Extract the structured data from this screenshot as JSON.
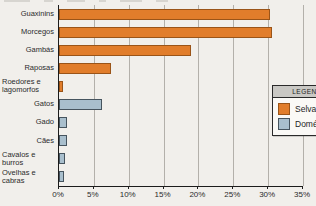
{
  "chart_data": {
    "type": "bar",
    "orientation": "horizontal",
    "title": "",
    "xlabel": "",
    "ylabel": "",
    "xlim": [
      0,
      35
    ],
    "grid": true,
    "xticks": [
      "0%",
      "5%",
      "10%",
      "15%",
      "20%",
      "25%",
      "30%",
      "35%"
    ],
    "categories": [
      "Guaxinins",
      "Morcegos",
      "Gambás",
      "Raposas",
      "Roedores e\nlagomorfos",
      "Gatos",
      "Gado",
      "Cães",
      "Cavalos e\nburros",
      "Ovelhas e\ncabras"
    ],
    "values": [
      30.2,
      30.5,
      19.0,
      7.5,
      0.6,
      6.2,
      1.2,
      1.1,
      0.8,
      0.7
    ],
    "series_of_category": [
      "Selvagem",
      "Selvagem",
      "Selvagem",
      "Selvagem",
      "Selvagem",
      "Doméstico",
      "Doméstico",
      "Doméstico",
      "Doméstico",
      "Doméstico"
    ],
    "legend": {
      "position": "inside-right",
      "title": "LEGENDA",
      "entries": [
        {
          "label": "Selvagem",
          "color": "#e17d2b",
          "border": "#9a5418"
        },
        {
          "label": "Doméstico",
          "color": "#a9bfcd",
          "border": "#46545e"
        }
      ]
    },
    "colors": {
      "background": "#f1efeb",
      "gridline": "#b3b0aa",
      "axis": "#1c1c1c",
      "text": "#2b2b2b"
    }
  }
}
